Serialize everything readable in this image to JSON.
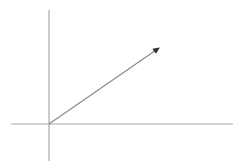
{
  "diagram": {
    "width": 243,
    "height": 167,
    "colors": {
      "axis": "#a8a8a8",
      "vector": "#8a8a8a",
      "arrowhead": "#333333",
      "background": "#ffffff"
    },
    "origin": {
      "x": 49,
      "y": 124
    },
    "x_axis": {
      "x1": 11,
      "y1": 124,
      "x2": 233,
      "y2": 124
    },
    "y_axis": {
      "x1": 49,
      "y1": 10,
      "x2": 49,
      "y2": 161
    },
    "vector": {
      "x1": 49,
      "y1": 124,
      "x2": 159,
      "y2": 48
    }
  }
}
